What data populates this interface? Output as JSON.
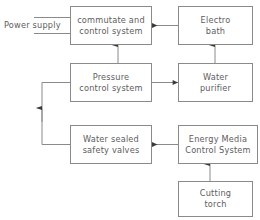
{
  "diagram": {
    "type": "block-flow-diagram",
    "background_color": "#ffffff",
    "line_color": "#8a8a8a",
    "text_color": "#5d5d5d",
    "nodes": [
      {
        "id": "commutate-and-control-system",
        "lines": [
          "commutate and",
          "control system"
        ],
        "x": 70,
        "y": 6,
        "w": 82,
        "h": 39
      },
      {
        "id": "electro-bath",
        "lines": [
          "Electro",
          "bath"
        ],
        "x": 178,
        "y": 6,
        "w": 75,
        "h": 39
      },
      {
        "id": "pressure-control-system",
        "lines": [
          "Pressure",
          "control system"
        ],
        "x": 70,
        "y": 63,
        "w": 82,
        "h": 39
      },
      {
        "id": "water-purifier",
        "lines": [
          "Water",
          "purifier"
        ],
        "x": 178,
        "y": 63,
        "w": 75,
        "h": 39
      },
      {
        "id": "water-sealed-safety-valves",
        "lines": [
          "Water sealed",
          "safety valves"
        ],
        "x": 70,
        "y": 125,
        "w": 82,
        "h": 39
      },
      {
        "id": "energy-media-control-system",
        "lines": [
          "Energy Media",
          "Control System"
        ],
        "x": 178,
        "y": 125,
        "w": 80,
        "h": 39
      },
      {
        "id": "cutting-torch",
        "lines": [
          "Cutting",
          "torch"
        ],
        "x": 178,
        "y": 181,
        "w": 75,
        "h": 36
      }
    ],
    "labels": [
      {
        "id": "power-supply",
        "text": "Power supply",
        "x": 4,
        "y": 21
      }
    ],
    "connections": [
      {
        "id": "power-supply-upper-lead",
        "from": "power-supply",
        "to": "commutate-and-control-system",
        "arrow": "none"
      },
      {
        "id": "power-supply-lower-lead",
        "from": "power-supply",
        "to": "commutate-and-control-system",
        "arrow": "none"
      },
      {
        "id": "electro-bath-to-commutate",
        "from": "electro-bath",
        "to": "commutate-and-control-system",
        "arrow": "left"
      },
      {
        "id": "water-purifier-to-electro-bath",
        "from": "water-purifier",
        "to": "electro-bath",
        "arrow": "up"
      },
      {
        "id": "pressure-control-to-commutate",
        "from": "pressure-control-system",
        "to": "commutate-and-control-system",
        "arrow": "up"
      },
      {
        "id": "pressure-control-to-water-purifier",
        "from": "pressure-control-system",
        "to": "water-purifier",
        "arrow": "right"
      },
      {
        "id": "water-sealed-valves-to-pressure-control",
        "from": "water-sealed-safety-valves",
        "to": "pressure-control-system",
        "arrow": "up"
      },
      {
        "id": "energy-media-to-water-sealed-valves",
        "from": "energy-media-control-system",
        "to": "water-sealed-safety-valves",
        "arrow": "left"
      },
      {
        "id": "cutting-torch-to-energy-media",
        "from": "cutting-torch",
        "to": "energy-media-control-system",
        "arrow": "up"
      }
    ]
  }
}
